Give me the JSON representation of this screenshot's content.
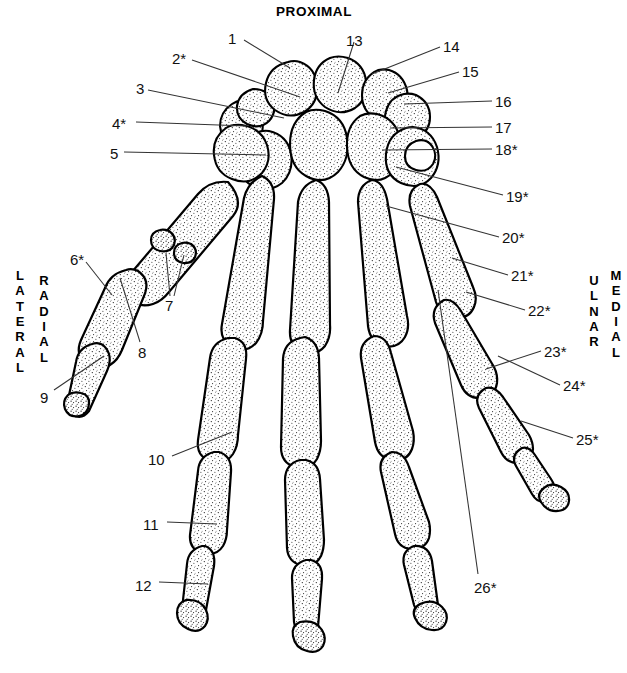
{
  "figure": {
    "title": "PROXIMAL",
    "orientation_labels": [
      {
        "name": "lateral",
        "text": "LATERAL",
        "x": 12,
        "y": 268
      },
      {
        "name": "radial",
        "text": "RADIAL",
        "x": 36,
        "y": 273
      },
      {
        "name": "ulnar",
        "text": "ULNAR",
        "x": 586,
        "y": 273
      },
      {
        "name": "medial",
        "text": "MEDIAL",
        "x": 608,
        "y": 268
      }
    ],
    "ink_color": "#000000",
    "paper_color": "#ffffff"
  },
  "labels": [
    {
      "id": "1",
      "text": "1",
      "x": 228,
      "y": 31,
      "anchor": "start",
      "leaders": [
        [
          244,
          40,
          290,
          68
        ]
      ]
    },
    {
      "id": "2",
      "text": "2*",
      "x": 172,
      "y": 51,
      "anchor": "start",
      "leaders": [
        [
          192,
          60,
          300,
          97
        ]
      ]
    },
    {
      "id": "3",
      "text": "3",
      "x": 136,
      "y": 81,
      "anchor": "start",
      "leaders": [
        [
          148,
          90,
          284,
          118
        ]
      ]
    },
    {
      "id": "4",
      "text": "4*",
      "x": 112,
      "y": 116,
      "anchor": "start",
      "leaders": [
        [
          136,
          122,
          246,
          126
        ]
      ]
    },
    {
      "id": "5",
      "text": "5",
      "x": 110,
      "y": 146,
      "anchor": "start",
      "leaders": [
        [
          124,
          152,
          266,
          155
        ]
      ]
    },
    {
      "id": "6",
      "text": "6*",
      "x": 70,
      "y": 252,
      "anchor": "start",
      "leaders": [
        [
          86,
          262,
          112,
          295
        ]
      ]
    },
    {
      "id": "7",
      "text": "7",
      "x": 165,
      "y": 298,
      "anchor": "start",
      "leaders": [
        [
          170,
          296,
          166,
          253
        ],
        [
          174,
          296,
          184,
          255
        ]
      ]
    },
    {
      "id": "8",
      "text": "8",
      "x": 138,
      "y": 345,
      "anchor": "start",
      "leaders": [
        [
          140,
          342,
          120,
          278
        ]
      ]
    },
    {
      "id": "9",
      "text": "9",
      "x": 40,
      "y": 390,
      "anchor": "start",
      "leaders": [
        [
          54,
          390,
          104,
          356
        ]
      ]
    },
    {
      "id": "10",
      "text": "10",
      "x": 148,
      "y": 452,
      "anchor": "start",
      "leaders": [
        [
          172,
          456,
          232,
          432
        ]
      ]
    },
    {
      "id": "11",
      "text": "11",
      "x": 143,
      "y": 517,
      "anchor": "start",
      "leaders": [
        [
          167,
          522,
          217,
          524
        ]
      ]
    },
    {
      "id": "12",
      "text": "12",
      "x": 135,
      "y": 578,
      "anchor": "start",
      "leaders": [
        [
          159,
          582,
          208,
          584
        ]
      ]
    },
    {
      "id": "13",
      "text": "13",
      "x": 346,
      "y": 33,
      "anchor": "start",
      "leaders": [
        [
          354,
          42,
          338,
          93
        ]
      ]
    },
    {
      "id": "14",
      "text": "14",
      "x": 443,
      "y": 39,
      "anchor": "start",
      "leaders": [
        [
          440,
          47,
          372,
          74
        ]
      ]
    },
    {
      "id": "15",
      "text": "15",
      "x": 462,
      "y": 64,
      "anchor": "start",
      "leaders": [
        [
          459,
          72,
          388,
          93
        ]
      ]
    },
    {
      "id": "16",
      "text": "16",
      "x": 495,
      "y": 94,
      "anchor": "start",
      "leaders": [
        [
          492,
          101,
          404,
          104
        ]
      ]
    },
    {
      "id": "17",
      "text": "17",
      "x": 495,
      "y": 120,
      "anchor": "start",
      "leaders": [
        [
          492,
          127,
          390,
          128
        ]
      ]
    },
    {
      "id": "18",
      "text": "18*",
      "x": 495,
      "y": 142,
      "anchor": "start",
      "leaders": [
        [
          492,
          149,
          382,
          150
        ]
      ]
    },
    {
      "id": "19",
      "text": "19*",
      "x": 506,
      "y": 189,
      "anchor": "start",
      "leaders": [
        [
          503,
          195,
          396,
          167
        ]
      ]
    },
    {
      "id": "20",
      "text": "20*",
      "x": 502,
      "y": 230,
      "anchor": "start",
      "leaders": [
        [
          499,
          237,
          386,
          206
        ]
      ]
    },
    {
      "id": "21",
      "text": "21*",
      "x": 511,
      "y": 268,
      "anchor": "start",
      "leaders": [
        [
          508,
          275,
          452,
          258
        ]
      ]
    },
    {
      "id": "22",
      "text": "22*",
      "x": 528,
      "y": 303,
      "anchor": "start",
      "leaders": [
        [
          525,
          310,
          466,
          292
        ]
      ]
    },
    {
      "id": "23",
      "text": "23*",
      "x": 544,
      "y": 344,
      "anchor": "start",
      "leaders": [
        [
          541,
          351,
          486,
          369
        ]
      ]
    },
    {
      "id": "24",
      "text": "24*",
      "x": 563,
      "y": 378,
      "anchor": "start",
      "leaders": [
        [
          560,
          385,
          498,
          356
        ]
      ]
    },
    {
      "id": "25",
      "text": "25*",
      "x": 576,
      "y": 432,
      "anchor": "start",
      "leaders": [
        [
          573,
          438,
          521,
          421
        ]
      ]
    },
    {
      "id": "26",
      "text": "26*",
      "x": 474,
      "y": 580,
      "anchor": "start",
      "leaders": [
        [
          478,
          574,
          438,
          290
        ]
      ]
    }
  ]
}
